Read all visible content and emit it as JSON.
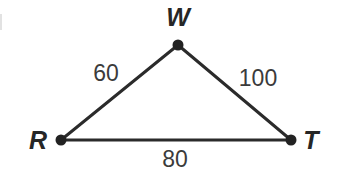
{
  "figure": {
    "kind": "geometry-triangle-diagram",
    "background_color": "#ffffff",
    "stroke_color": "#2b2b2b",
    "vertex_color": "#222222",
    "label_color": "#262626",
    "side_label_color": "#3b3b3b",
    "stroke_width": 3,
    "vertex_radius": 5.5,
    "width": 340,
    "height": 173
  },
  "vertices": [
    {
      "name": "W",
      "label": "W",
      "x": 178,
      "y": 45,
      "label_x": 178,
      "label_y": 17
    },
    {
      "name": "R",
      "label": "R",
      "x": 61,
      "y": 140,
      "label_x": 38,
      "label_y": 140
    },
    {
      "name": "T",
      "label": "T",
      "x": 291,
      "y": 140,
      "label_x": 311,
      "label_y": 140
    }
  ],
  "edges": [
    {
      "name": "RW",
      "from": "R",
      "to": "W",
      "length_label": "60",
      "label_x": 106,
      "label_y": 73
    },
    {
      "name": "WT",
      "from": "W",
      "to": "T",
      "length_label": "100",
      "label_x": 258,
      "label_y": 78
    },
    {
      "name": "RT",
      "from": "R",
      "to": "T",
      "length_label": "80",
      "label_x": 175,
      "label_y": 159
    }
  ],
  "geometry_text": {
    "vertex_w": "W",
    "vertex_r": "R",
    "vertex_t": "T",
    "side_rw": "60",
    "side_wt": "100",
    "side_rt": "80"
  }
}
